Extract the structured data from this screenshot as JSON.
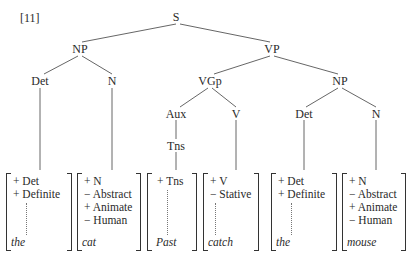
{
  "example_number": "[11]",
  "nodes": {
    "S": "S",
    "NP1": "NP",
    "VP": "VP",
    "Det1": "Det",
    "N1": "N",
    "VGp": "VGp",
    "NP2": "NP",
    "Aux": "Aux",
    "V": "V",
    "Det2": "Det",
    "N2": "N",
    "Tns": "Tns"
  },
  "matrices": [
    {
      "features": [
        "+ Det",
        "+ Definite"
      ],
      "dotted": true,
      "word": "the"
    },
    {
      "features": [
        "+ N",
        "− Abstract",
        "+ Animate",
        "− Human"
      ],
      "dotted": false,
      "word": "cat"
    },
    {
      "features": [
        "+ Tns"
      ],
      "dotted": true,
      "word": "Past"
    },
    {
      "features": [
        "+ V",
        "− Stative"
      ],
      "dotted": true,
      "word": "catch"
    },
    {
      "features": [
        "+ Det",
        "+ Definite"
      ],
      "dotted": true,
      "word": "the"
    },
    {
      "features": [
        "+ N",
        "− Abstract",
        "+ Animate",
        "− Human"
      ],
      "dotted": false,
      "word": "mouse"
    }
  ]
}
